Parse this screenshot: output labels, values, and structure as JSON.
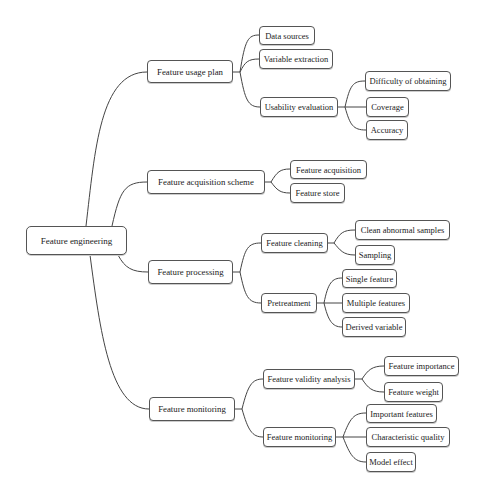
{
  "diagram": {
    "type": "mind-map",
    "root": {
      "label": "Feature engineering",
      "children": [
        {
          "label": "Feature usage plan",
          "children": [
            {
              "label": "Data sources"
            },
            {
              "label": "Variable extraction"
            },
            {
              "label": "Usability evaluation",
              "children": [
                {
                  "label": "Difficulty of obtaining"
                },
                {
                  "label": "Coverage"
                },
                {
                  "label": "Accuracy"
                }
              ]
            }
          ]
        },
        {
          "label": "Feature acquisition scheme",
          "children": [
            {
              "label": "Feature acquisition"
            },
            {
              "label": "Feature store"
            }
          ]
        },
        {
          "label": "Feature processing",
          "children": [
            {
              "label": "Feature cleaning",
              "children": [
                {
                  "label": "Clean abnormal samples"
                },
                {
                  "label": "Sampling"
                }
              ]
            },
            {
              "label": "Pretreatment",
              "children": [
                {
                  "label": "Single feature"
                },
                {
                  "label": "Multiple features"
                },
                {
                  "label": "Derived variable"
                }
              ]
            }
          ]
        },
        {
          "label": "Feature monitoring",
          "children": [
            {
              "label": "Feature validity analysis",
              "children": [
                {
                  "label": "Feature importance"
                },
                {
                  "label": "Feature weight"
                }
              ]
            },
            {
              "label": "Feature monitoring",
              "children": [
                {
                  "label": "Important features"
                },
                {
                  "label": "Characteristic quality"
                },
                {
                  "label": "Model effect"
                }
              ]
            }
          ]
        }
      ]
    },
    "colors": {
      "line": "#444444",
      "border": "#555555",
      "background": "#ffffff",
      "text": "#222222"
    }
  }
}
